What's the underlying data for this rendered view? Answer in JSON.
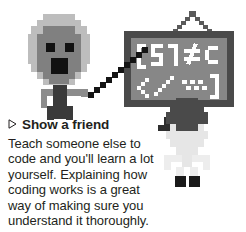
{
  "tip": {
    "bullet_icon": "triangle-right-icon",
    "heading": "Show a friend",
    "body": "Teach someone else to code and you'll learn a lot yourself. Explaining how coding works is a great way of making sure you understand it thoroughly."
  },
  "illustration": {
    "name": "pixel-art-teacher-and-friend-at-code-board",
    "board_text": "[51≠c \\…]",
    "figures": [
      {
        "name": "teacher-figure",
        "hair_color": "#bdbdbd",
        "skin_color": "#808080",
        "body_color": "#3a3a3a"
      },
      {
        "name": "friend-figure",
        "hair_color": "#4a4a4a",
        "body_color": "#e2e2e2"
      }
    ],
    "board": {
      "frame_color": "#4a4a4a",
      "surface_color": "#878787",
      "glyph_color": "#ffffff"
    },
    "pointer_color": "#1a1a1a",
    "background": "#ffffff"
  }
}
